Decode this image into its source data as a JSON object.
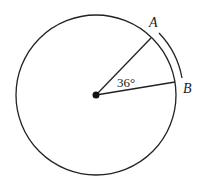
{
  "diagram": {
    "type": "circle-sector",
    "center": {
      "x": 96,
      "y": 95
    },
    "radius": 80,
    "points": [
      {
        "id": "A",
        "label": "A",
        "x": 151,
        "y": 38
      },
      {
        "id": "B",
        "label": "B",
        "x": 175,
        "y": 82
      }
    ],
    "angle": {
      "value": 36,
      "label": "36°"
    },
    "highlighted_arc": {
      "from": "A",
      "to": "B",
      "offset": 6
    },
    "colors": {
      "stroke": "#222222",
      "background": "#ffffff"
    }
  }
}
